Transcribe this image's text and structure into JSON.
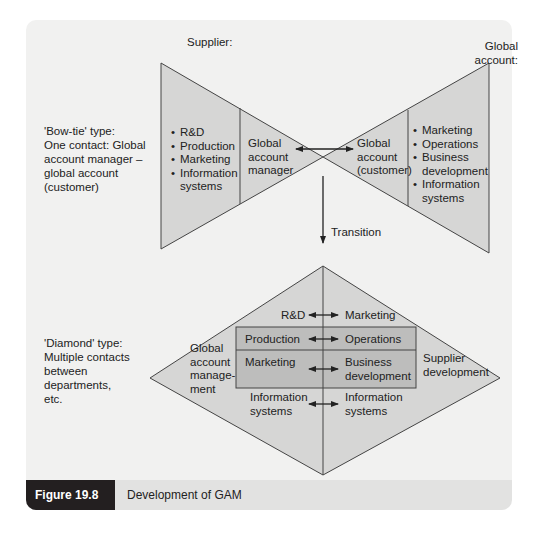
{
  "figure": {
    "label": "Figure 19.8",
    "title": "Development of GAM"
  },
  "colors": {
    "panel_bg": "#f1f1f0",
    "shape_fill": "#d6d6d5",
    "box_fill": "#bdbdbc",
    "stroke": "#444444",
    "caption_bg": "#e2e2e1",
    "label_bg": "#231f20"
  },
  "bowtie": {
    "supplier_heading": "Supplier:",
    "account_heading_line1": "Global",
    "account_heading_line2": "account:",
    "description": [
      "'Bow-tie' type:",
      "One contact: Global",
      "account manager –",
      "global account",
      "(customer)"
    ],
    "supplier_departments": [
      "R&D",
      "Production",
      "Marketing",
      "Information systems"
    ],
    "supplier_contact": [
      "Global",
      "account",
      "manager"
    ],
    "customer_contact": [
      "Global",
      "account",
      "(customer)"
    ],
    "customer_departments": [
      "Marketing",
      "Operations",
      "Business development",
      "Information systems"
    ]
  },
  "transition_label": "Transition",
  "diamond": {
    "description": [
      "'Diamond' type:",
      "Multiple contacts",
      "between",
      "departments,",
      "etc."
    ],
    "left_label": [
      "Global",
      "account",
      "manage-",
      "ment"
    ],
    "right_label": [
      "Supplier",
      "development"
    ],
    "pairs": [
      {
        "left": "R&D",
        "right": "Marketing"
      },
      {
        "left": "Production",
        "right": "Operations"
      },
      {
        "left": "Marketing",
        "right": "Business development"
      },
      {
        "left": "Information systems",
        "right": "Information systems"
      }
    ]
  }
}
